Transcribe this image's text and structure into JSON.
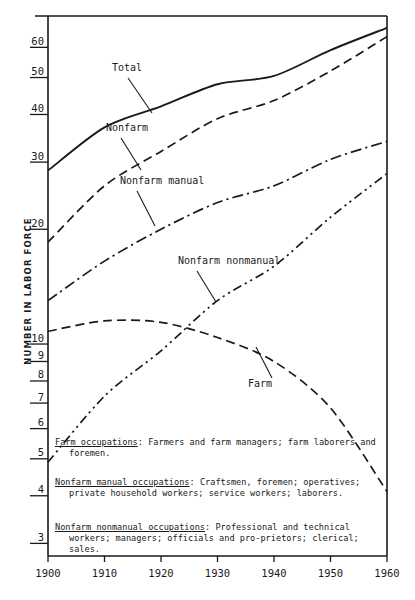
{
  "chart_data": {
    "type": "line",
    "title": "",
    "xlabel": "",
    "ylabel": "NUMBER IN LABOR FORCE",
    "yscale": "log",
    "ylim": [
      2.8,
      72
    ],
    "xlim": [
      1900,
      1960
    ],
    "grid": false,
    "legend": "inline-annotations",
    "x": [
      1900,
      1910,
      1920,
      1930,
      1940,
      1950,
      1960
    ],
    "ytick_labels": [
      "3",
      "4",
      "5",
      "6",
      "7",
      "8",
      "9",
      "10",
      "20",
      "30",
      "40",
      "50",
      "60"
    ],
    "ytick_values": [
      3,
      4,
      5,
      6,
      7,
      8,
      9,
      10,
      20,
      30,
      40,
      50,
      60
    ],
    "xtick_labels": [
      "1900",
      "1910",
      "1920",
      "1930",
      "1940",
      "1950",
      "1960"
    ],
    "series": [
      {
        "name": "Total",
        "style": "solid",
        "values": [
          28.5,
          37.0,
          42.0,
          48.0,
          50.5,
          59.0,
          67.5
        ]
      },
      {
        "name": "Nonfarm",
        "style": "dashed",
        "values": [
          18.5,
          26.0,
          32.0,
          39.0,
          43.5,
          52.0,
          64.0
        ]
      },
      {
        "name": "Nonfarm manual",
        "style": "dash-dot",
        "values": [
          13.0,
          16.5,
          20.0,
          23.5,
          26.0,
          30.5,
          34.0
        ]
      },
      {
        "name": "Nonfarm nonmanual",
        "style": "dash-dot-dot",
        "values": [
          4.9,
          7.3,
          9.6,
          13.0,
          16.0,
          21.5,
          28.0
        ]
      },
      {
        "name": "Farm",
        "style": "dashed",
        "values": [
          10.8,
          11.5,
          11.4,
          10.4,
          9.0,
          6.8,
          4.1
        ]
      }
    ],
    "annotations": [
      {
        "label": "Total",
        "x": 112,
        "y": 71
      },
      {
        "label": "Nonfarm",
        "x": 106,
        "y": 131
      },
      {
        "label": "Nonfarm manual",
        "x": 120,
        "y": 184
      },
      {
        "label": "Nonfarm nonmanual",
        "x": 178,
        "y": 264
      },
      {
        "label": "Farm",
        "x": 248,
        "y": 387
      }
    ]
  },
  "notes": [
    {
      "id": "farm-occupations",
      "term": "Farm occupations",
      "text": ":  Farmers and farm managers; farm laborers and foremen."
    },
    {
      "id": "nonfarm-manual-occupations",
      "term": "Nonfarm manual occupations",
      "text": ":  Craftsmen, foremen; operatives; private household workers; service workers; laborers."
    },
    {
      "id": "nonfarm-nonmanual-occupations",
      "term": "Nonfarm nonmanual occupations",
      "text": ":  Professional and technical workers; managers; officials and pro‑prietors; clerical; sales."
    }
  ]
}
